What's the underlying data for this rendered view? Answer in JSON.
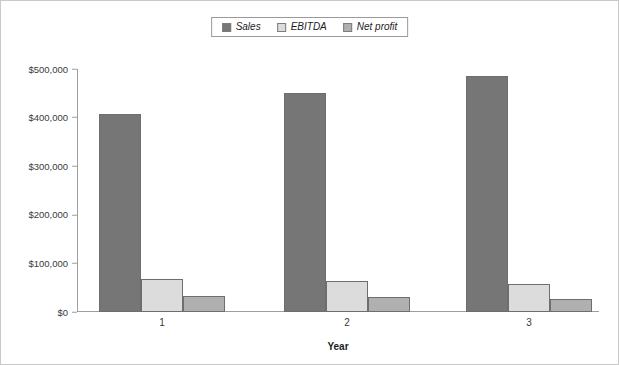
{
  "chart_data": {
    "type": "bar",
    "title": "",
    "xlabel": "Year",
    "ylabel": "",
    "categories": [
      "1",
      "2",
      "3"
    ],
    "series": [
      {
        "name": "Sales",
        "color": "#767676",
        "values": [
          407000,
          450000,
          485000
        ]
      },
      {
        "name": "EBITDA",
        "color": "#dcdcdc",
        "values": [
          68000,
          64000,
          58000
        ]
      },
      {
        "name": "Net profit",
        "color": "#b0b0b0",
        "values": [
          33000,
          31000,
          27000
        ]
      }
    ],
    "ylim": [
      0,
      500000
    ],
    "ytick_values": [
      0,
      100000,
      200000,
      300000,
      400000,
      500000
    ],
    "ytick_labels": [
      "$0",
      "$100,000",
      "$200,000",
      "$300,000",
      "$400,000",
      "$500,000"
    ],
    "grid": false,
    "legend_position": "top-center"
  },
  "legend": {
    "entries": [
      {
        "label": "Sales"
      },
      {
        "label": "EBITDA"
      },
      {
        "label": "Net profit"
      }
    ]
  }
}
